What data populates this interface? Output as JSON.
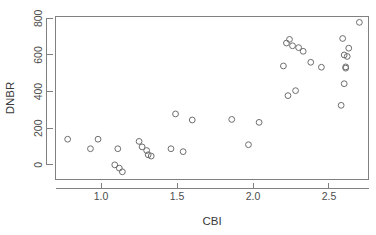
{
  "chart_data": {
    "type": "scatter",
    "title": "",
    "xlabel": "CBI",
    "ylabel": "DNBR",
    "xlim": [
      0.7,
      2.76
    ],
    "ylim": [
      -80,
      810
    ],
    "grid": false,
    "legend": null,
    "xticks": [
      1.0,
      1.5,
      2.0,
      2.5
    ],
    "xtick_labels": [
      "1.0",
      "1.5",
      "2.0",
      "2.5"
    ],
    "yticks": [
      0,
      200,
      400,
      600,
      800
    ],
    "ytick_labels": [
      "0",
      "200",
      "400",
      "600",
      "800"
    ],
    "marker": "open-circle",
    "marker_color": "#6e6e6e",
    "points": [
      {
        "x": 0.78,
        "y": 140
      },
      {
        "x": 0.93,
        "y": 88
      },
      {
        "x": 0.98,
        "y": 140
      },
      {
        "x": 1.09,
        "y": 0
      },
      {
        "x": 1.11,
        "y": 88
      },
      {
        "x": 1.12,
        "y": -18
      },
      {
        "x": 1.14,
        "y": -38
      },
      {
        "x": 1.25,
        "y": 128
      },
      {
        "x": 1.27,
        "y": 98
      },
      {
        "x": 1.3,
        "y": 78
      },
      {
        "x": 1.31,
        "y": 55
      },
      {
        "x": 1.33,
        "y": 48
      },
      {
        "x": 1.46,
        "y": 88
      },
      {
        "x": 1.49,
        "y": 278
      },
      {
        "x": 1.54,
        "y": 72
      },
      {
        "x": 1.6,
        "y": 245
      },
      {
        "x": 1.86,
        "y": 248
      },
      {
        "x": 1.97,
        "y": 110
      },
      {
        "x": 2.04,
        "y": 232
      },
      {
        "x": 2.2,
        "y": 540
      },
      {
        "x": 2.22,
        "y": 665
      },
      {
        "x": 2.23,
        "y": 378
      },
      {
        "x": 2.24,
        "y": 685
      },
      {
        "x": 2.26,
        "y": 650
      },
      {
        "x": 2.28,
        "y": 405
      },
      {
        "x": 2.3,
        "y": 640
      },
      {
        "x": 2.33,
        "y": 620
      },
      {
        "x": 2.38,
        "y": 560
      },
      {
        "x": 2.45,
        "y": 533
      },
      {
        "x": 2.58,
        "y": 325
      },
      {
        "x": 2.59,
        "y": 690
      },
      {
        "x": 2.6,
        "y": 443
      },
      {
        "x": 2.6,
        "y": 600
      },
      {
        "x": 2.61,
        "y": 535
      },
      {
        "x": 2.61,
        "y": 528
      },
      {
        "x": 2.62,
        "y": 592
      },
      {
        "x": 2.63,
        "y": 637
      },
      {
        "x": 2.7,
        "y": 778
      }
    ]
  },
  "axes": {
    "x_title": "CBI",
    "y_title": "DNBR"
  }
}
